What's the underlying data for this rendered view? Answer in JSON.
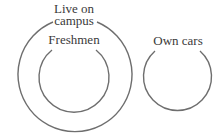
{
  "diagram": {
    "type": "euler",
    "stroke_color": "#6e6e6e",
    "text_color": "#3a3a3a",
    "sets": [
      {
        "id": "live-on-campus",
        "label_line1": "Live on",
        "label_line2": "campus",
        "contains": [
          "freshmen"
        ]
      },
      {
        "id": "freshmen",
        "label": "Freshmen",
        "inside": "live-on-campus"
      },
      {
        "id": "own-cars",
        "label": "Own cars",
        "disjoint_from": [
          "live-on-campus",
          "freshmen"
        ]
      }
    ]
  }
}
